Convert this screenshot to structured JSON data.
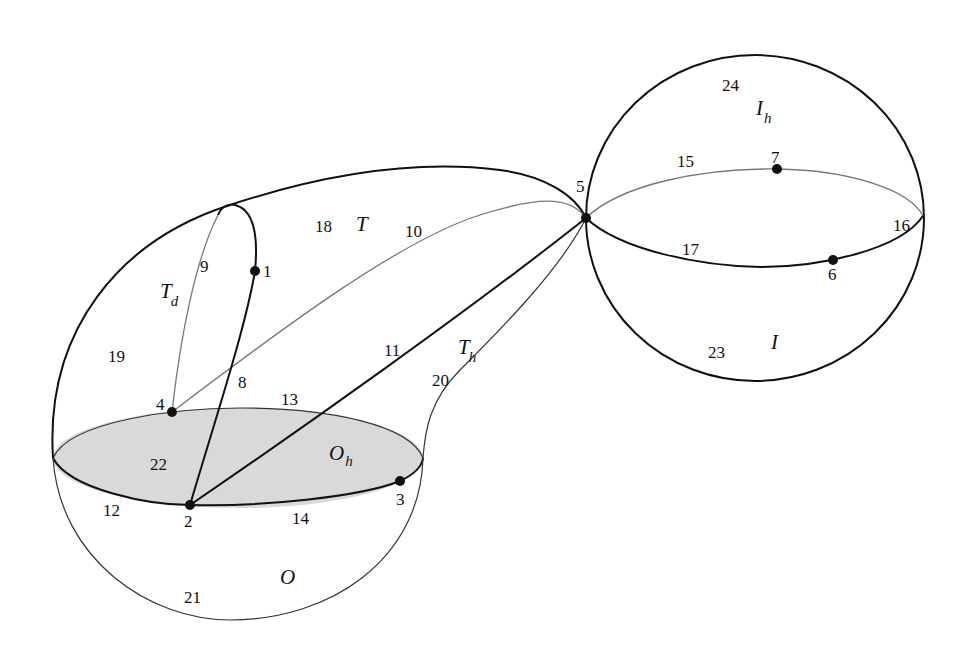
{
  "figure": {
    "background": "#ffffff",
    "shade_color": "#d9d9d9",
    "line_color": "#111111"
  },
  "vertices": [
    {
      "id": "1",
      "label": "1",
      "x": 255,
      "y": 271
    },
    {
      "id": "2",
      "label": "2",
      "x": 190,
      "y": 505
    },
    {
      "id": "3",
      "label": "3",
      "x": 400,
      "y": 481
    },
    {
      "id": "4",
      "label": "4",
      "x": 172,
      "y": 412
    },
    {
      "id": "5",
      "label": "5",
      "x": 586,
      "y": 218
    },
    {
      "id": "6",
      "label": "6",
      "x": 833,
      "y": 260
    },
    {
      "id": "7",
      "label": "7",
      "x": 777,
      "y": 169
    }
  ],
  "edge_labels": [
    {
      "id": "8",
      "label": "8"
    },
    {
      "id": "9",
      "label": "9"
    },
    {
      "id": "10",
      "label": "10"
    },
    {
      "id": "11",
      "label": "11"
    },
    {
      "id": "12",
      "label": "12"
    },
    {
      "id": "13",
      "label": "13"
    },
    {
      "id": "14",
      "label": "14"
    },
    {
      "id": "15",
      "label": "15"
    },
    {
      "id": "16",
      "label": "16"
    },
    {
      "id": "17",
      "label": "17"
    },
    {
      "id": "20",
      "label": "20"
    }
  ],
  "face_labels": [
    {
      "id": "18",
      "label": "18"
    },
    {
      "id": "19",
      "label": "19"
    },
    {
      "id": "21",
      "label": "21"
    },
    {
      "id": "22",
      "label": "22"
    },
    {
      "id": "23",
      "label": "23"
    },
    {
      "id": "24",
      "label": "24"
    }
  ],
  "region_labels": {
    "T": {
      "main": "T",
      "sub": ""
    },
    "Td": {
      "main": "T",
      "sub": "d"
    },
    "Th": {
      "main": "T",
      "sub": "h"
    },
    "O": {
      "main": "O",
      "sub": ""
    },
    "Oh": {
      "main": "O",
      "sub": "h"
    },
    "I": {
      "main": "I",
      "sub": ""
    },
    "Ih": {
      "main": "I",
      "sub": "h"
    }
  }
}
